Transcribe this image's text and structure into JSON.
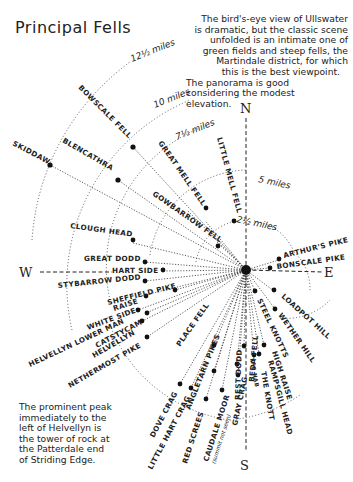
{
  "title": "Principal Fells",
  "note_top": [
    "The bird's-eye view of Ullswater",
    "is dramatic, but the classic scene",
    "unfolded is an intimate one of",
    "green fields and steep fells, the",
    "Martindale district, for which",
    "this is the best viewpoint.",
    "The panorama is good",
    "considering the modest",
    "elevation."
  ],
  "note_bottom": [
    "The prominent peak",
    "immediately to the",
    "left of Helvellyn is",
    "the tower of rock at",
    "the Patterdale end",
    "of Striding Edge."
  ],
  "compass": {
    "north": "N",
    "south": "S",
    "west": "W",
    "east": "E"
  },
  "distance_rings": [
    {
      "label": "2½ miles"
    },
    {
      "label": "5 miles"
    },
    {
      "label": "7½ miles"
    },
    {
      "label": "10 miles"
    },
    {
      "label": "12½ miles"
    }
  ],
  "fells": [
    {
      "name": "SKIDDAW"
    },
    {
      "name": "BLENCATHRA"
    },
    {
      "name": "BOWSCALE FELL"
    },
    {
      "name": "GREAT MELL FELL"
    },
    {
      "name": "LITTLE MELL FELL"
    },
    {
      "name": "GOWBARROW FELL"
    },
    {
      "name": "CLOUGH HEAD"
    },
    {
      "name": "GREAT DODD"
    },
    {
      "name": "HART SIDE"
    },
    {
      "name": "STYBARROW DODD"
    },
    {
      "name": "SHEFFIELD PIKE"
    },
    {
      "name": "RAISE"
    },
    {
      "name": "WHITE SIDE"
    },
    {
      "name": "HELVELLYN LOWER MAN"
    },
    {
      "name": "CATSTYCAM"
    },
    {
      "name": "HELVELLYN"
    },
    {
      "name": "NETHERMOST PIKE"
    },
    {
      "name": "PLACE FELL"
    },
    {
      "name": "DOVE CRAG"
    },
    {
      "name": "LITTLE HART CRAG"
    },
    {
      "name": "ANGLETARN PIKES"
    },
    {
      "name": "RED SCREES"
    },
    {
      "name": "CAUDALE MOOR"
    },
    {
      "name": "(summit not seen)"
    },
    {
      "name": "GRAY CRAG"
    },
    {
      "name": "BEDA FELL"
    },
    {
      "name": "REST DODD"
    },
    {
      "name": "THE NAB"
    },
    {
      "name": "THE KNOTT"
    },
    {
      "name": "RAMPSGILL HEAD"
    },
    {
      "name": "HIGH RAISE"
    },
    {
      "name": "STEEL KNOTTS"
    },
    {
      "name": "WETHER HILL"
    },
    {
      "name": "LOADPOT HILL"
    },
    {
      "name": "ARTHUR'S PIKE"
    },
    {
      "name": "BONSCALE PIKE"
    }
  ]
}
